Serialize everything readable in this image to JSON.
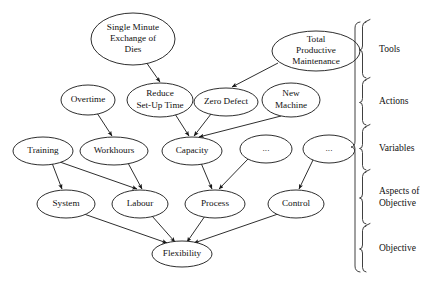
{
  "figure": {
    "type": "hierarchical-causal-diagram",
    "background_color": "#ffffff",
    "stroke_color": "#161616",
    "text_color": "#111111"
  },
  "nodes": [
    {
      "id": "smed",
      "label_lines": [
        "Single Minute",
        "Exchange of",
        "Dies"
      ],
      "cx": 133,
      "cy": 39,
      "rx": 42,
      "ry": 26,
      "font_size": 9.2
    },
    {
      "id": "tpm",
      "label_lines": [
        "Total",
        "Productive",
        "Maintenance"
      ],
      "cx": 316,
      "cy": 51,
      "rx": 44,
      "ry": 20,
      "font_size": 9.2
    },
    {
      "id": "overtime",
      "label_lines": [
        "Overtime"
      ],
      "cx": 88,
      "cy": 100,
      "rx": 27,
      "ry": 15,
      "font_size": 9.2
    },
    {
      "id": "reduce",
      "label_lines": [
        "Reduce",
        "Set-Up Time"
      ],
      "cx": 160,
      "cy": 100,
      "rx": 33,
      "ry": 17,
      "font_size": 9.2
    },
    {
      "id": "zerodef",
      "label_lines": [
        "Zero Defect"
      ],
      "cx": 226,
      "cy": 102,
      "rx": 32,
      "ry": 14,
      "font_size": 9.2
    },
    {
      "id": "newmach",
      "label_lines": [
        "New",
        "Machine"
      ],
      "cx": 291,
      "cy": 100,
      "rx": 29,
      "ry": 17,
      "font_size": 9.2
    },
    {
      "id": "training",
      "label_lines": [
        "Training"
      ],
      "cx": 43,
      "cy": 151,
      "rx": 30,
      "ry": 14,
      "font_size": 9.2
    },
    {
      "id": "workhours",
      "label_lines": [
        "Workhours"
      ],
      "cx": 114,
      "cy": 151,
      "rx": 34,
      "ry": 14,
      "font_size": 9.2
    },
    {
      "id": "capacity",
      "label_lines": [
        "Capacity"
      ],
      "cx": 192,
      "cy": 151,
      "rx": 30,
      "ry": 14,
      "font_size": 9.2
    },
    {
      "id": "dots1",
      "label_lines": [
        "..."
      ],
      "cx": 266,
      "cy": 149,
      "rx": 26,
      "ry": 14,
      "font_size": 9.2
    },
    {
      "id": "dots2",
      "label_lines": [
        "..."
      ],
      "cx": 329,
      "cy": 149,
      "rx": 26,
      "ry": 14,
      "font_size": 9.2
    },
    {
      "id": "system",
      "label_lines": [
        "System"
      ],
      "cx": 66,
      "cy": 204,
      "rx": 29,
      "ry": 14,
      "font_size": 9.2
    },
    {
      "id": "labour",
      "label_lines": [
        "Labour"
      ],
      "cx": 140,
      "cy": 204,
      "rx": 28,
      "ry": 14,
      "font_size": 9.2
    },
    {
      "id": "process",
      "label_lines": [
        "Process"
      ],
      "cx": 215,
      "cy": 204,
      "rx": 30,
      "ry": 14,
      "font_size": 9.2
    },
    {
      "id": "control",
      "label_lines": [
        "Control"
      ],
      "cx": 296,
      "cy": 204,
      "rx": 28,
      "ry": 14,
      "font_size": 9.2
    },
    {
      "id": "flex",
      "label_lines": [
        "Flexibility"
      ],
      "cx": 182,
      "cy": 254,
      "rx": 30,
      "ry": 13,
      "font_size": 9.2
    }
  ],
  "edges": [
    {
      "from": "smed",
      "to": "reduce",
      "x1": 146,
      "y1": 62,
      "x2": 160,
      "y2": 82
    },
    {
      "from": "tpm",
      "to": "zerodef",
      "x1": 278,
      "y1": 63,
      "x2": 232,
      "y2": 87
    },
    {
      "from": "overtime",
      "to": "workhours",
      "x1": 97,
      "y1": 113,
      "x2": 112,
      "y2": 136
    },
    {
      "from": "reduce",
      "to": "capacity",
      "x1": 175,
      "y1": 114,
      "x2": 189,
      "y2": 136
    },
    {
      "from": "zerodef",
      "to": "capacity",
      "x1": 211,
      "y1": 114,
      "x2": 194,
      "y2": 136
    },
    {
      "from": "newmach",
      "to": "capacity",
      "x1": 281,
      "y1": 116,
      "x2": 199,
      "y2": 137
    },
    {
      "from": "training",
      "to": "system",
      "x1": 52,
      "y1": 163,
      "x2": 62,
      "y2": 189
    },
    {
      "from": "training",
      "to": "labour",
      "x1": 57,
      "y1": 161,
      "x2": 137,
      "y2": 189
    },
    {
      "from": "workhours",
      "to": "labour",
      "x1": 128,
      "y1": 163,
      "x2": 142,
      "y2": 189
    },
    {
      "from": "capacity",
      "to": "process",
      "x1": 201,
      "y1": 163,
      "x2": 212,
      "y2": 189
    },
    {
      "from": "dots1",
      "to": "process",
      "x1": 248,
      "y1": 159,
      "x2": 219,
      "y2": 189
    },
    {
      "from": "dots2",
      "to": "control",
      "x1": 313,
      "y1": 160,
      "x2": 299,
      "y2": 189
    },
    {
      "from": "system",
      "to": "flex",
      "x1": 84,
      "y1": 214,
      "x2": 167,
      "y2": 243
    },
    {
      "from": "labour",
      "to": "flex",
      "x1": 152,
      "y1": 216,
      "x2": 175,
      "y2": 242
    },
    {
      "from": "process",
      "to": "flex",
      "x1": 205,
      "y1": 216,
      "x2": 187,
      "y2": 242
    },
    {
      "from": "control",
      "to": "flex",
      "x1": 278,
      "y1": 214,
      "x2": 194,
      "y2": 243
    }
  ],
  "bands": [
    {
      "id": "tools",
      "label_lines": [
        "Tools"
      ],
      "y_top": 22,
      "y_bottom": 78,
      "label_y": 50
    },
    {
      "id": "actions",
      "label_lines": [
        "Actions"
      ],
      "y_top": 80,
      "y_bottom": 125,
      "label_y": 102
    },
    {
      "id": "variables",
      "label_lines": [
        "Variables"
      ],
      "y_top": 127,
      "y_bottom": 170,
      "label_y": 149
    },
    {
      "id": "aspects",
      "label_lines": [
        "Aspects of",
        "Objective"
      ],
      "y_top": 172,
      "y_bottom": 224,
      "label_y": 198
    },
    {
      "id": "objective",
      "label_lines": [
        "Objective"
      ],
      "y_top": 226,
      "y_bottom": 272,
      "label_y": 249
    }
  ],
  "brace": {
    "spine_x": 366,
    "outer_x": 360,
    "tip_x": 372,
    "label_x": 379,
    "y_top": 22,
    "y_bottom": 272,
    "font_size": 9.5
  }
}
